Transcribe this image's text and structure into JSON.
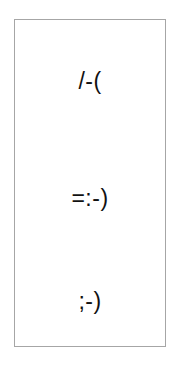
{
  "panel": {
    "border_color": "#a6a6a6",
    "items": [
      {
        "text": "/-("
      },
      {
        "text": "=:-)"
      },
      {
        "text": ";-)"
      }
    ]
  }
}
